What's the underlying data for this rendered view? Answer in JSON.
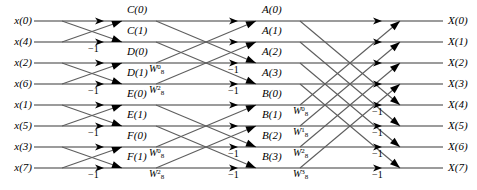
{
  "diagram": {
    "rows": 8,
    "stages": 3,
    "line_color": "#6b6b6b",
    "arrow_color": "#000000",
    "text_color": "#000000",
    "background": "#ffffff"
  },
  "inputs": [
    {
      "label": "x(0)",
      "row": 0
    },
    {
      "label": "x(4)",
      "row": 1
    },
    {
      "label": "x(2)",
      "row": 2
    },
    {
      "label": "x(6)",
      "row": 3
    },
    {
      "label": "x(1)",
      "row": 4
    },
    {
      "label": "x(5)",
      "row": 5
    },
    {
      "label": "x(3)",
      "row": 6
    },
    {
      "label": "x(7)",
      "row": 7
    }
  ],
  "outputs": [
    {
      "label": "X(0)",
      "row": 0
    },
    {
      "label": "X(1)",
      "row": 1
    },
    {
      "label": "X(2)",
      "row": 2
    },
    {
      "label": "X(3)",
      "row": 3
    },
    {
      "label": "X(4)",
      "row": 4
    },
    {
      "label": "X(5)",
      "row": 5
    },
    {
      "label": "X(6)",
      "row": 6
    },
    {
      "label": "X(7)",
      "row": 7
    }
  ],
  "stage1_outputs": [
    {
      "label": "C(0)",
      "row": 0
    },
    {
      "label": "C(1)",
      "row": 1
    },
    {
      "label": "D(0)",
      "row": 2
    },
    {
      "label": "D(1)",
      "row": 3
    },
    {
      "label": "E(0)",
      "row": 4
    },
    {
      "label": "E(1)",
      "row": 5
    },
    {
      "label": "F(0)",
      "row": 6
    },
    {
      "label": "F(1)",
      "row": 7
    }
  ],
  "stage2_outputs": [
    {
      "label": "A(0)",
      "row": 0
    },
    {
      "label": "A(1)",
      "row": 1
    },
    {
      "label": "A(2)",
      "row": 2
    },
    {
      "label": "A(3)",
      "row": 3
    },
    {
      "label": "B(0)",
      "row": 4
    },
    {
      "label": "B(1)",
      "row": 5
    },
    {
      "label": "B(2)",
      "row": 6
    },
    {
      "label": "B(3)",
      "row": 7
    }
  ],
  "stage1_minus_ones": [
    {
      "label": "−1",
      "row": 1
    },
    {
      "label": "−1",
      "row": 3
    },
    {
      "label": "−1",
      "row": 5
    },
    {
      "label": "−1",
      "row": 7
    }
  ],
  "stage2_minus_ones": [
    {
      "label": "−1",
      "row": 2
    },
    {
      "label": "−1",
      "row": 3
    },
    {
      "label": "−1",
      "row": 6
    },
    {
      "label": "−1",
      "row": 7
    }
  ],
  "stage3_minus_ones": [
    {
      "label": "−1",
      "row": 4
    },
    {
      "label": "−1",
      "row": 5
    },
    {
      "label": "−1",
      "row": 6
    },
    {
      "label": "−1",
      "row": 7
    }
  ],
  "stage2_twiddles": [
    {
      "base": "W",
      "sub": "8",
      "sup": "0",
      "row": 2
    },
    {
      "base": "W",
      "sub": "8",
      "sup": "2",
      "row": 3
    },
    {
      "base": "W",
      "sub": "8",
      "sup": "0",
      "row": 6
    },
    {
      "base": "W",
      "sub": "8",
      "sup": "2",
      "row": 7
    }
  ],
  "stage3_twiddles": [
    {
      "base": "W",
      "sub": "8",
      "sup": "0",
      "row": 4
    },
    {
      "base": "W",
      "sub": "8",
      "sup": "1",
      "row": 5
    },
    {
      "base": "W",
      "sub": "8",
      "sup": "2",
      "row": 6
    },
    {
      "base": "W",
      "sub": "8",
      "sup": "3",
      "row": 7
    }
  ],
  "chart_data": {
    "type": "diagram",
    "stage1_pairs": [
      [
        0,
        1
      ],
      [
        2,
        3
      ],
      [
        4,
        5
      ],
      [
        6,
        7
      ]
    ],
    "stage2_pairs": [
      [
        0,
        2
      ],
      [
        1,
        3
      ],
      [
        4,
        6
      ],
      [
        5,
        7
      ]
    ],
    "stage3_pairs": [
      [
        0,
        4
      ],
      [
        1,
        5
      ],
      [
        2,
        6
      ],
      [
        3,
        7
      ]
    ]
  }
}
